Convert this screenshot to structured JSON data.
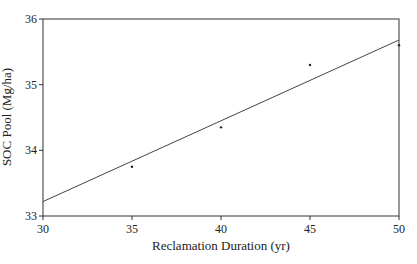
{
  "chart_data": {
    "type": "scatter",
    "title": "",
    "xlabel": "Reclamation Duration (yr)",
    "ylabel": "SOC Pool (Mg/ha)",
    "xlim": [
      30,
      50
    ],
    "ylim": [
      33,
      36
    ],
    "x_ticks": [
      30,
      35,
      40,
      45,
      50
    ],
    "y_ticks": [
      33,
      34,
      35,
      36
    ],
    "grid": false,
    "legend": null,
    "series": [
      {
        "name": "Observed SOC pool",
        "x": [
          35,
          40,
          45,
          50
        ],
        "y": [
          33.75,
          34.35,
          35.3,
          35.6
        ],
        "marker": "dot"
      }
    ],
    "fit_line": {
      "name": "Linear regression",
      "x": [
        30,
        50
      ],
      "y": [
        33.22,
        35.68
      ]
    }
  },
  "colors": {
    "axis": "#333333",
    "line": "#444444",
    "points": "#222222",
    "background": "#ffffff"
  }
}
